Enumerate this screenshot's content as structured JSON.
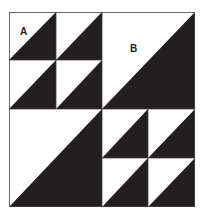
{
  "diagram": {
    "type": "quilt-block",
    "colors": {
      "dark": "#231f20",
      "light": "#ffffff",
      "border": "#555555"
    },
    "labels": {
      "a": "A",
      "b": "B"
    },
    "quadrants": [
      {
        "position": "top-left",
        "unit": "A",
        "subdivision": "2x2 half-square triangles"
      },
      {
        "position": "top-right",
        "unit": "B",
        "subdivision": "1 half-square triangle"
      },
      {
        "position": "bottom-left",
        "unit": "B",
        "subdivision": "1 half-square triangle"
      },
      {
        "position": "bottom-right",
        "unit": "A",
        "subdivision": "2x2 half-square triangles"
      }
    ]
  }
}
